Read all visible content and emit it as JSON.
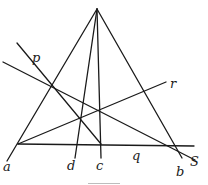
{
  "figure": {
    "labels": {
      "a": "a",
      "b": "b",
      "c": "c",
      "d": "d",
      "p": "p",
      "q": "q",
      "r": "r",
      "s": "S"
    }
  }
}
